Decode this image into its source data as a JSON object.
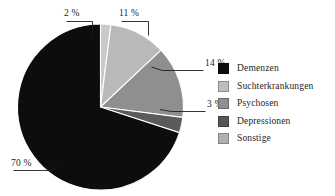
{
  "chart_data": {
    "type": "pie",
    "title": "",
    "subtitle": "",
    "xlabel": "",
    "ylabel": "",
    "unit": "%",
    "legend_position": "right",
    "grid": false,
    "categories": [
      "Demenzen",
      "Suchterkrankungen",
      "Psychosen",
      "Depressionen",
      "Sonstige"
    ],
    "values": [
      70,
      11,
      14,
      3,
      2
    ],
    "value_labels": [
      "70 %",
      "11 %",
      "14 %",
      "3 %",
      "2 %"
    ],
    "colors": [
      "#0d0d0d",
      "#b9b9b9",
      "#8f8f8f",
      "#5b5b5b",
      "#c9c9c9"
    ],
    "slices": [
      {
        "label": "Sonstige",
        "value": 2,
        "value_label": "2 %",
        "color": "#c9c9c9"
      },
      {
        "label": "Suchterkrankungen",
        "value": 11,
        "value_label": "11 %",
        "color": "#b9b9b9"
      },
      {
        "label": "Psychosen",
        "value": 14,
        "value_label": "14 %",
        "color": "#8f8f8f"
      },
      {
        "label": "Depressionen",
        "value": 3,
        "value_label": "3 %",
        "color": "#5b5b5b"
      },
      {
        "label": "Demenzen",
        "value": 70,
        "value_label": "70 %",
        "color": "#0d0d0d"
      }
    ]
  },
  "callouts": {
    "two": "2 %",
    "eleven": "11 %",
    "fourteen": "14 %",
    "three": "3 %",
    "seventy": "70 %"
  },
  "legend": {
    "items": [
      {
        "label": "Demenzen",
        "color": "#0d0d0d"
      },
      {
        "label": "Suchterkrankungen",
        "color": "#bdbdbd"
      },
      {
        "label": "Psychosen",
        "color": "#8f8f8f"
      },
      {
        "label": "Depressionen",
        "color": "#565656"
      },
      {
        "label": "Sonstige",
        "color": "#b0b0b0"
      }
    ]
  }
}
